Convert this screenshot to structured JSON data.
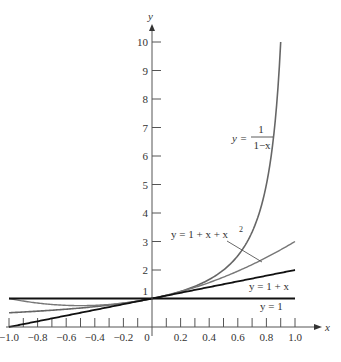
{
  "chart_data": {
    "type": "line",
    "title": "",
    "xlabel": "x",
    "ylabel": "y",
    "xlim": [
      -1.0,
      1.0
    ],
    "ylim": [
      0,
      10
    ],
    "grid": false,
    "x_ticks": [
      -1.0,
      -0.9,
      -0.8,
      -0.7,
      -0.6,
      -0.5,
      -0.4,
      -0.3,
      -0.2,
      -0.1,
      0,
      0.1,
      0.2,
      0.3,
      0.4,
      0.5,
      0.6,
      0.7,
      0.8,
      0.9,
      1.0
    ],
    "x_tick_labels": [
      "-1.0",
      "-0.8",
      "-0.6",
      "-0.4",
      "-0.2",
      "0",
      "0.2",
      "0.4",
      "0.6",
      "0.8",
      "1.0"
    ],
    "y_ticks": [
      1,
      2,
      3,
      4,
      5,
      6,
      7,
      8,
      9,
      10
    ],
    "y_tick_labels": [
      "1",
      "2",
      "3",
      "4",
      "5",
      "6",
      "7",
      "8",
      "9",
      "10"
    ],
    "series": [
      {
        "name": "y = 1/(1-x)",
        "label": "y = 1/(1−x)",
        "color": "#666666",
        "x": [
          -1.0,
          -0.8,
          -0.6,
          -0.4,
          -0.2,
          0,
          0.2,
          0.4,
          0.5,
          0.6,
          0.7,
          0.8,
          0.85,
          0.9
        ],
        "values": [
          0.5,
          0.556,
          0.625,
          0.714,
          0.833,
          1.0,
          1.25,
          1.667,
          2.0,
          2.5,
          3.333,
          5.0,
          6.667,
          10.0
        ]
      },
      {
        "name": "y = 1 + x + x^2",
        "label": "y = 1 + x + x²",
        "color": "#777777",
        "x": [
          -1.0,
          -0.8,
          -0.6,
          -0.4,
          -0.2,
          0,
          0.2,
          0.4,
          0.6,
          0.8,
          1.0
        ],
        "values": [
          1.0,
          0.84,
          0.76,
          0.76,
          0.84,
          1.0,
          1.24,
          1.56,
          1.96,
          2.44,
          3.0
        ]
      },
      {
        "name": "y = 1 + x",
        "label": "y = 1 + x",
        "color": "#111111",
        "x": [
          -1.0,
          1.0
        ],
        "values": [
          0.0,
          2.0
        ]
      },
      {
        "name": "y = 1",
        "label": "y = 1",
        "color": "#111111",
        "x": [
          -1.0,
          1.0
        ],
        "values": [
          1.0,
          1.0
        ]
      }
    ],
    "annotations": [
      {
        "text": "y = 1/(1−x)",
        "near": [
          0.6,
          5.8
        ]
      },
      {
        "text": "y = 1 + x + x²",
        "near": [
          0.3,
          3.2
        ],
        "leader_to": [
          0.77,
          2.3
        ]
      },
      {
        "text": "y = 1 + x",
        "near": [
          0.75,
          1.4
        ]
      },
      {
        "text": "y = 1",
        "near": [
          0.8,
          0.7
        ]
      }
    ]
  },
  "labels": {
    "x_axis": "x",
    "y_axis": "y",
    "curve_inverse_prefix": "y =",
    "curve_inverse_num": "1",
    "curve_inverse_den": "1−x",
    "curve_quadratic": "y = 1 + x + x",
    "curve_quadratic_sup": "2",
    "curve_linear": "y = 1 + x",
    "curve_const": "y = 1"
  }
}
